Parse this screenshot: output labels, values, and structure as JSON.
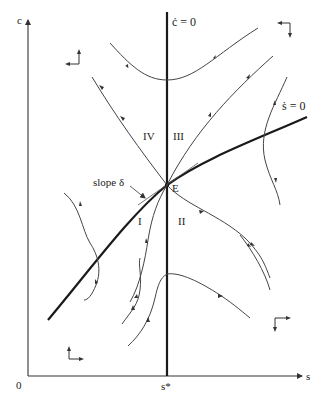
{
  "figure": {
    "type": "phase-diagram",
    "axes": {
      "y_label": "c",
      "x_label": "s",
      "origin_label": "0",
      "x_tick_label": "s*"
    },
    "loci": {
      "c_dot_zero": "ċ = 0",
      "s_dot_zero": "ṡ = 0"
    },
    "equilibrium_label": "E",
    "slope_annotation": "slope δ",
    "regions": [
      "I",
      "II",
      "III",
      "IV"
    ],
    "direction_indicators": [
      {
        "region": "upper-left",
        "arrows": [
          "left",
          "up"
        ]
      },
      {
        "region": "upper-right",
        "arrows": [
          "left",
          "down"
        ]
      },
      {
        "region": "lower-left",
        "arrows": [
          "up",
          "right"
        ]
      },
      {
        "region": "lower-right",
        "arrows": [
          "right",
          "down"
        ]
      }
    ]
  }
}
